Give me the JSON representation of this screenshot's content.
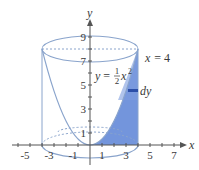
{
  "diagram": {
    "type": "solid-of-revolution",
    "curve_label_prefix": "y = ",
    "curve_frac_num": "1",
    "curve_frac_den": "2",
    "curve_var": "x",
    "curve_exp": "2",
    "line_label": "x = 4",
    "strip_label": "dy",
    "axis_x_label": "x",
    "axis_y_label": "y",
    "x_ticks": [
      "-5",
      "-3",
      "-1",
      "1",
      "3",
      "5",
      "7"
    ],
    "y_ticks": [
      "1",
      "3",
      "5",
      "7",
      "9"
    ],
    "colors": {
      "outline": "#8aa4cc",
      "fill": "#5b83d6",
      "strip": "#2c4fa8",
      "axis": "#555555"
    }
  }
}
